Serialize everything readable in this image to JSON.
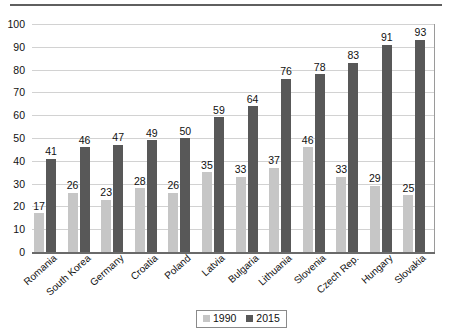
{
  "chart_data": {
    "type": "bar",
    "title": "",
    "xlabel": "",
    "ylabel": "",
    "ylim": [
      0,
      100
    ],
    "ytick_step": 10,
    "yticks": [
      "0",
      "10",
      "20",
      "30",
      "40",
      "50",
      "60",
      "70",
      "80",
      "90",
      "100"
    ],
    "grid": true,
    "legend_position": "bottom-center",
    "categories": [
      "Romania",
      "South Korea",
      "Germany",
      "Croatia",
      "Poland",
      "Latvia",
      "Bulgaria",
      "Lithuania",
      "Slovenia",
      "Czech Rep.",
      "Hungary",
      "Slovakia"
    ],
    "series": [
      {
        "name": "1990",
        "color": "#c6c6c6",
        "values": [
          17,
          26,
          23,
          28,
          26,
          35,
          33,
          37,
          46,
          33,
          29,
          25
        ]
      },
      {
        "name": "2015",
        "color": "#585858",
        "values": [
          41,
          46,
          47,
          49,
          50,
          59,
          64,
          76,
          78,
          83,
          91,
          93
        ]
      }
    ]
  },
  "legend": {
    "items": [
      {
        "label": "1990",
        "color": "#c6c6c6"
      },
      {
        "label": "2015",
        "color": "#585858"
      }
    ]
  },
  "colors": {
    "series_1990": "#c6c6c6",
    "series_2015": "#585858",
    "gridline": "#d2d2d2",
    "axis": "#6a6a6a",
    "text": "#111111",
    "background": "#ffffff"
  }
}
